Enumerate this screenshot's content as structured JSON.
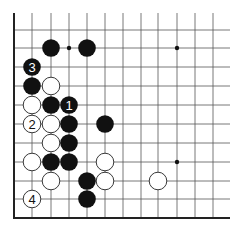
{
  "diagram": {
    "type": "go-board-partial",
    "colors": {
      "black": "#111111",
      "white": "#ffffff",
      "line": "#555555",
      "edge": "#222222"
    },
    "grid": {
      "x_lines": [
        14,
        32,
        51,
        69,
        87,
        105,
        123,
        141,
        158,
        177,
        195,
        213
      ],
      "y_lines": [
        30,
        48,
        67,
        86,
        105,
        124,
        143,
        162,
        181,
        199,
        218
      ],
      "top_open_y": 13,
      "right_open_x": 230,
      "left_edge_x": 14,
      "bottom_edge_y": 218
    },
    "star_points": [
      {
        "col": 3,
        "row": 1
      },
      {
        "col": 9,
        "row": 1
      },
      {
        "col": 9,
        "row": 7
      }
    ],
    "stones": [
      {
        "color": "black",
        "col": 2,
        "row": 1,
        "label": ""
      },
      {
        "color": "black",
        "col": 4,
        "row": 1,
        "label": ""
      },
      {
        "color": "black",
        "col": 1,
        "row": 2,
        "label": "3"
      },
      {
        "color": "black",
        "col": 1,
        "row": 3,
        "label": ""
      },
      {
        "color": "white",
        "col": 2,
        "row": 3,
        "label": ""
      },
      {
        "color": "white",
        "col": 1,
        "row": 4,
        "label": ""
      },
      {
        "color": "black",
        "col": 2,
        "row": 4,
        "label": ""
      },
      {
        "color": "black",
        "col": 3,
        "row": 4,
        "label": "1"
      },
      {
        "color": "white",
        "col": 1,
        "row": 5,
        "label": "2"
      },
      {
        "color": "white",
        "col": 2,
        "row": 5,
        "label": ""
      },
      {
        "color": "black",
        "col": 3,
        "row": 5,
        "label": ""
      },
      {
        "color": "black",
        "col": 5,
        "row": 5,
        "label": ""
      },
      {
        "color": "white",
        "col": 2,
        "row": 6,
        "label": ""
      },
      {
        "color": "black",
        "col": 3,
        "row": 6,
        "label": ""
      },
      {
        "color": "white",
        "col": 1,
        "row": 7,
        "label": ""
      },
      {
        "color": "black",
        "col": 2,
        "row": 7,
        "label": ""
      },
      {
        "color": "black",
        "col": 3,
        "row": 7,
        "label": ""
      },
      {
        "color": "white",
        "col": 5,
        "row": 7,
        "label": ""
      },
      {
        "color": "white",
        "col": 2,
        "row": 8,
        "label": ""
      },
      {
        "color": "black",
        "col": 4,
        "row": 8,
        "label": ""
      },
      {
        "color": "white",
        "col": 5,
        "row": 8,
        "label": ""
      },
      {
        "color": "white",
        "col": 8,
        "row": 8,
        "label": ""
      },
      {
        "color": "white",
        "col": 1,
        "row": 9,
        "label": "4"
      },
      {
        "color": "black",
        "col": 4,
        "row": 9,
        "label": ""
      }
    ]
  }
}
